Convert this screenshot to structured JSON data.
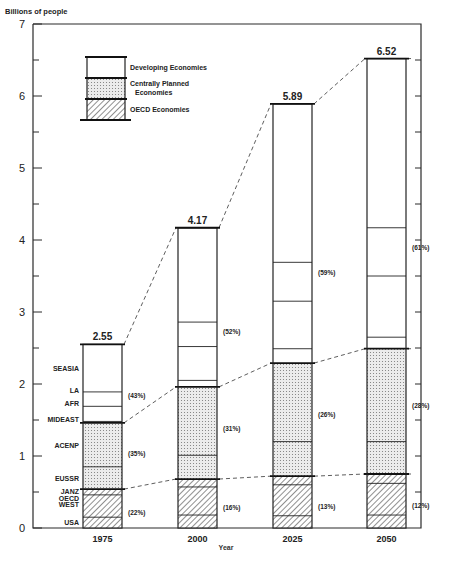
{
  "chart_data": {
    "type": "bar",
    "subtype": "stacked",
    "title": "",
    "ylabel": "Billions of people",
    "xlabel": "Year",
    "ylim": [
      0,
      7
    ],
    "yticks_major": [
      0,
      1,
      2,
      3,
      4,
      5,
      6,
      7
    ],
    "yticks_minor_step": 0.5,
    "grid": false,
    "categories": [
      "1975",
      "2000",
      "2025",
      "2050"
    ],
    "totals": [
      2.55,
      4.17,
      5.89,
      6.52
    ],
    "series": [
      {
        "name": "OECD Economies",
        "pattern": "hatch",
        "values": [
          0.54,
          0.68,
          0.72,
          0.75
        ],
        "percent_labels": [
          "(22%)",
          "(16%)",
          "(13%)",
          "(12%)"
        ]
      },
      {
        "name": "Centrally Planned Economies",
        "pattern": "dots",
        "values": [
          0.92,
          1.28,
          1.57,
          1.74
        ],
        "percent_labels": [
          "(35%)",
          "(31%)",
          "(26%)",
          "(28%)"
        ]
      },
      {
        "name": "Developing Economies",
        "pattern": "blank",
        "values": [
          1.09,
          2.21,
          3.6,
          4.03
        ],
        "percent_labels": [
          "(43%)",
          "(52%)",
          "(59%)",
          "(61%)"
        ]
      }
    ],
    "segment_boundaries": [
      [
        0.15,
        0.46,
        0.54,
        0.85,
        1.46,
        1.48,
        1.69,
        1.89,
        2.55
      ],
      [
        0.18,
        0.57,
        0.68,
        1.01,
        1.96,
        2.05,
        2.52,
        2.86,
        4.17
      ],
      [
        0.17,
        0.6,
        0.72,
        1.2,
        2.29,
        2.49,
        3.15,
        3.69,
        5.89
      ],
      [
        0.18,
        0.62,
        0.75,
        1.2,
        2.49,
        2.65,
        3.5,
        4.17,
        6.52
      ]
    ],
    "group_boundary_indices": [
      2,
      4
    ],
    "region_labels_1975": [
      {
        "label": "USA",
        "y": 0.08
      },
      {
        "label": "WEST",
        "y": 0.33
      },
      {
        "label": "OECD",
        "y": 0.42
      },
      {
        "label": "JANZ",
        "y": 0.52
      },
      {
        "label": "EUSSR",
        "y": 0.7
      },
      {
        "label": "ACENP",
        "y": 1.15
      },
      {
        "label": "MIDEAST",
        "y": 1.52
      },
      {
        "label": "AFR",
        "y": 1.73
      },
      {
        "label": "LA",
        "y": 1.92
      },
      {
        "label": "SEASIA",
        "y": 2.22
      }
    ],
    "legend": {
      "position": "upper-left",
      "entries": [
        "Developing Economies",
        "Centrally Planned Economies",
        "OECD Economies"
      ],
      "entry_lines": [
        [
          "Developing Economies"
        ],
        [
          "Centrally Planned",
          "Economies"
        ],
        [
          "OECD Economies"
        ]
      ]
    }
  },
  "colors": {
    "ink": "#222222",
    "background": "#ffffff",
    "dot_fill": "#e2e2e2"
  }
}
